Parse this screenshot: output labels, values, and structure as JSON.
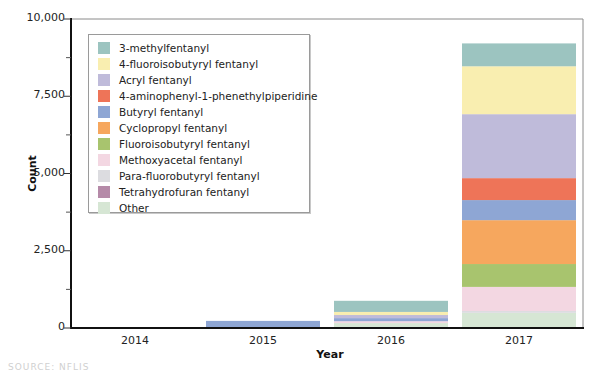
{
  "chart_data": {
    "type": "bar",
    "stacked": true,
    "title": "",
    "xlabel": "Year",
    "ylabel": "Count",
    "ylim": [
      0,
      10000
    ],
    "yticks": [
      0,
      2500,
      5000,
      7500,
      10000
    ],
    "ytick_labels": [
      "0",
      "2,500",
      "5,000",
      "7,500",
      "10,000"
    ],
    "minor_yticks": [
      1250,
      3750,
      6250,
      8750
    ],
    "categories": [
      "2014",
      "2015",
      "2016",
      "2017"
    ],
    "legend_position": "upper left (inside plot)",
    "grid": false,
    "series": [
      {
        "name": "Other",
        "color": "#d6e6d4",
        "values": [
          0,
          0,
          160,
          490
        ]
      },
      {
        "name": "Para-fluorobutyryl fentanyl",
        "color": "#dcdce0",
        "values": [
          0,
          0,
          0,
          60
        ]
      },
      {
        "name": "Tetrahydrofuran fentanyl",
        "color": "#b58aa8",
        "values": [
          0,
          0,
          0,
          0
        ]
      },
      {
        "name": "Methoxyacetal fentanyl",
        "color": "#f3d7e2",
        "values": [
          0,
          0,
          60,
          780
        ]
      },
      {
        "name": "Fluoroisobutyryl fentanyl",
        "color": "#a8c46e",
        "values": [
          0,
          0,
          0,
          740
        ]
      },
      {
        "name": "Cyclopropyl fentanyl",
        "color": "#f6a75e",
        "values": [
          0,
          0,
          0,
          1420
        ]
      },
      {
        "name": "Butyryl fentanyl",
        "color": "#8ea6d4",
        "values": [
          0,
          230,
          100,
          650
        ]
      },
      {
        "name": "4-aminophenyl-1-phenethylpiperidine",
        "color": "#ee7458",
        "values": [
          0,
          0,
          0,
          710
        ]
      },
      {
        "name": "Acryl fentanyl",
        "color": "#bfbbda",
        "values": [
          0,
          0,
          100,
          2070
        ]
      },
      {
        "name": "4-fluoroisobutyryl fentanyl",
        "color": "#f9eeb0",
        "values": [
          0,
          0,
          100,
          1550
        ]
      },
      {
        "name": "3-methylfentanyl",
        "color": "#9cc4c0",
        "values": [
          0,
          0,
          360,
          740
        ]
      }
    ],
    "legend_order": [
      "3-methylfentanyl",
      "4-fluoroisobutyryl fentanyl",
      "Acryl fentanyl",
      "4-aminophenyl-1-phenethylpiperidine",
      "Butyryl fentanyl",
      "Cyclopropyl fentanyl",
      "Fluoroisobutyryl fentanyl",
      "Methoxyacetal fentanyl",
      "Para-fluorobutyryl fentanyl",
      "Tetrahydrofuran fentanyl",
      "Other"
    ]
  },
  "source_note": "SOURCE: NFLIS"
}
